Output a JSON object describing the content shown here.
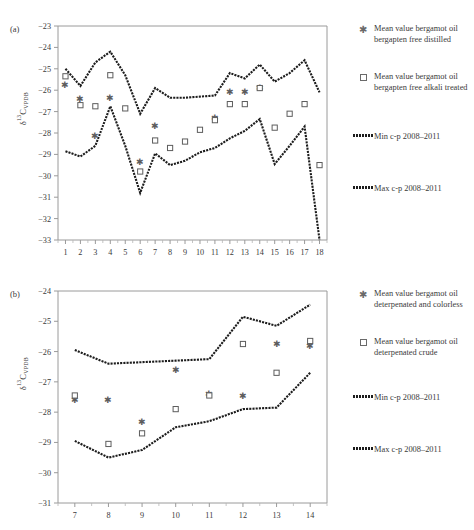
{
  "figure": {
    "panels": [
      {
        "tag": "(a)",
        "ylabel_main": "δ",
        "ylabel_sup": "13",
        "ylabel_mid": "C",
        "ylabel_sub": "VPDB",
        "legend": [
          {
            "marker": "asterisk-marker",
            "label": "Mean value bergamot oil bergapten free distilled"
          },
          {
            "marker": "square-marker",
            "label": "Mean value bergamot oil bergapten free alkali treated"
          },
          {
            "marker": "dashed-line",
            "label": "Min c-p 2008–2011"
          },
          {
            "marker": "dashed-line",
            "label": "Max c-p 2008–2011"
          }
        ]
      },
      {
        "tag": "(b)",
        "ylabel_main": "δ",
        "ylabel_sup": "13",
        "ylabel_mid": "C",
        "ylabel_sub": "VPDB",
        "legend": [
          {
            "marker": "asterisk-marker",
            "label": "Mean value bergamot oil deterpenated and colorless"
          },
          {
            "marker": "square-marker",
            "label": "Mean value bergamot oil deterpenated crude"
          },
          {
            "marker": "dashed-line",
            "label": "Min c-p 2008–2011"
          },
          {
            "marker": "dashed-line",
            "label": "Max c-p 2008–2011"
          }
        ]
      }
    ]
  },
  "chart_data": [
    {
      "type": "line",
      "panel": "(a)",
      "title": "",
      "xlabel": "",
      "ylabel": "δ13C VPDB",
      "xlim": [
        0.5,
        18.5
      ],
      "ylim": [
        -33,
        -23
      ],
      "yticks": [
        "-23",
        "-24",
        "-25",
        "-26",
        "-27",
        "-28",
        "-29",
        "-30",
        "-31",
        "-32",
        "-33"
      ],
      "xticks": [
        "1",
        "2",
        "3",
        "4",
        "5",
        "6",
        "7",
        "8",
        "9",
        "10",
        "11",
        "12",
        "13",
        "14",
        "15",
        "16",
        "17",
        "18"
      ],
      "grid": false,
      "legend_position": "right",
      "x": [
        1,
        2,
        3,
        4,
        5,
        6,
        7,
        8,
        9,
        10,
        11,
        12,
        13,
        14,
        15,
        16,
        17,
        18
      ],
      "series": [
        {
          "name": "Max c-p 2008-2011",
          "kind": "line",
          "values": [
            -25.0,
            -25.8,
            -24.7,
            -24.2,
            -25.3,
            -27.1,
            -25.9,
            -26.35,
            -26.35,
            -26.3,
            -26.25,
            -25.2,
            -25.45,
            -24.8,
            -25.6,
            -25.2,
            -24.6,
            -26.1
          ]
        },
        {
          "name": "Min c-p 2008-2011",
          "kind": "line",
          "values": [
            -28.85,
            -29.1,
            -28.6,
            -26.75,
            -28.6,
            -30.8,
            -28.95,
            -29.5,
            -29.3,
            -28.9,
            -28.7,
            -28.25,
            -27.9,
            -27.35,
            -29.45,
            -28.6,
            -27.7,
            -33.0
          ]
        },
        {
          "name": "Mean value bergamot oil bergapten free distilled",
          "kind": "scatter",
          "values": [
            -25.75,
            -26.4,
            -28.1,
            -26.35,
            null,
            -29.35,
            -27.65,
            null,
            null,
            null,
            -27.3,
            -26.05,
            -26.05,
            -25.9,
            null,
            null,
            null,
            null
          ]
        },
        {
          "name": "Mean value bergamot oil bergapten free alkali treated",
          "kind": "scatter",
          "values": [
            -25.35,
            -26.7,
            -26.75,
            -25.3,
            -26.85,
            -29.8,
            -28.35,
            -28.7,
            -28.4,
            -27.85,
            -27.4,
            -26.65,
            -26.65,
            -25.9,
            -27.75,
            -27.1,
            -26.65,
            -29.5
          ]
        }
      ]
    },
    {
      "type": "line",
      "panel": "(b)",
      "title": "",
      "xlabel": "",
      "ylabel": "δ13C VPDB",
      "xlim": [
        6.5,
        14.5
      ],
      "ylim": [
        -31,
        -24
      ],
      "yticks": [
        "-24",
        "-25",
        "-26",
        "-27",
        "-28",
        "-29",
        "-30",
        "-31"
      ],
      "xticks": [
        "7",
        "8",
        "9",
        "10",
        "11",
        "12",
        "13",
        "14"
      ],
      "grid": false,
      "legend_position": "right",
      "x": [
        7,
        8,
        9,
        10,
        11,
        12,
        13,
        14
      ],
      "series": [
        {
          "name": "Max c-p 2008-2011",
          "kind": "line",
          "values": [
            -25.95,
            -26.4,
            -26.35,
            -26.3,
            -26.25,
            -24.85,
            -25.15,
            -24.45
          ]
        },
        {
          "name": "Min c-p 2008-2011",
          "kind": "line",
          "values": [
            -28.95,
            -29.5,
            -29.25,
            -28.5,
            -28.3,
            -27.9,
            -27.85,
            -26.7
          ]
        },
        {
          "name": "Mean value bergamot oil deterpenated and colorless",
          "kind": "scatter",
          "values": [
            -27.6,
            -27.6,
            -28.3,
            -26.6,
            -27.4,
            -27.45,
            -25.75,
            -25.8
          ]
        },
        {
          "name": "Mean value bergamot oil deterpenated crude",
          "kind": "scatter",
          "values": [
            -27.45,
            -29.05,
            -28.7,
            -27.9,
            -27.45,
            -25.75,
            -26.7,
            -25.65
          ]
        }
      ]
    }
  ]
}
